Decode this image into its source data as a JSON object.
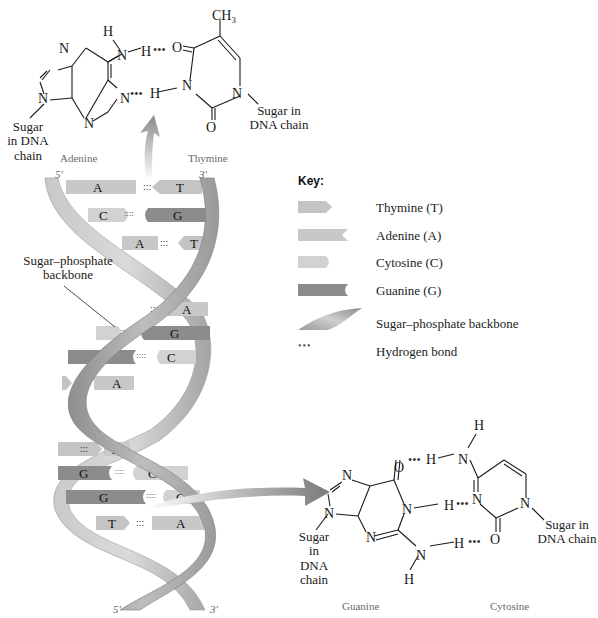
{
  "top_pair": {
    "left_base": "Adenine",
    "right_base": "Thymine",
    "methyl": "CH3",
    "left_sugar": [
      "Sugar",
      "in DNA",
      "chain"
    ],
    "right_sugar": [
      "Sugar in",
      "DNA chain"
    ],
    "atoms": {
      "N": "N",
      "H": "H",
      "O": "O"
    },
    "hbond": "•••"
  },
  "bottom_pair": {
    "left_base": "Guanine",
    "right_base": "Cytosine",
    "left_sugar": [
      "Sugar",
      "in DNA",
      "chain"
    ],
    "right_sugar": [
      "Sugar in",
      "DNA chain"
    ],
    "hbond": "•••"
  },
  "helix": {
    "backbone_label": [
      "Sugar–phosphate",
      "backbone"
    ],
    "top_left_end": "5′",
    "top_right_end": "3′",
    "bottom_left_end": "5′",
    "bottom_right_end": "3′",
    "base_pairs": [
      {
        "left": "A",
        "right": "T",
        "bonds": 2
      },
      {
        "left": "C",
        "right": "G",
        "bonds": 3
      },
      {
        "left": "A",
        "right": "T",
        "bonds": 2
      },
      {
        "left": "T",
        "right": "A",
        "bonds": 2
      },
      {
        "left": "C",
        "right": "G",
        "bonds": 3
      },
      {
        "left": "G",
        "right": "C",
        "bonds": 3
      },
      {
        "left": "T",
        "right": "A",
        "bonds": 2
      },
      {
        "left": "T",
        "right": "A",
        "bonds": 2
      },
      {
        "left": "G",
        "right": "C",
        "bonds": 3
      },
      {
        "left": "G",
        "right": "C",
        "bonds": 3
      },
      {
        "left": "T",
        "right": "A",
        "bonds": 2
      }
    ]
  },
  "key": {
    "title": "Key:",
    "items": [
      {
        "label": "Thymine (T)",
        "shape": "arrow-tip",
        "color": "#c4c4c4"
      },
      {
        "label": "Adenine (A)",
        "shape": "notch",
        "color": "#c8c8c8"
      },
      {
        "label": "Cytosine (C)",
        "shape": "rounded",
        "color": "#d0d0d0"
      },
      {
        "label": "Guanine (G)",
        "shape": "concave",
        "color": "#8a8a8a"
      },
      {
        "label": "Sugar–phosphate backbone",
        "shape": "ribbon",
        "color": "#a8a8a8"
      },
      {
        "label": "Hydrogen bond",
        "shape": "dots",
        "color": "#555555"
      }
    ]
  },
  "colors": {
    "thymine": "#c4c4c4",
    "adenine": "#c8c8c8",
    "cytosine": "#d2d2d2",
    "guanine": "#8c8c8c",
    "backbone_light": "#d4d4d4",
    "backbone_dark": "#8f8f8f",
    "text": "#1a1a1a"
  }
}
